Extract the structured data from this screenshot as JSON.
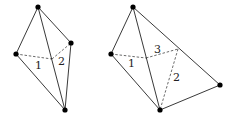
{
  "figures": [
    {
      "name": "left-tetrahedron",
      "vertices": {
        "top": [
          38,
          7
        ],
        "right": [
          71,
          43
        ],
        "left": [
          16,
          54
        ],
        "bottom": [
          65,
          110
        ]
      },
      "interior_point": [
        52,
        59
      ],
      "solid_edges": [
        [
          "top",
          "right"
        ],
        [
          "top",
          "left"
        ],
        [
          "top",
          "bottom"
        ],
        [
          "left",
          "bottom"
        ],
        [
          "right",
          "bottom"
        ]
      ],
      "dashed_edges": [
        [
          "left",
          "interior"
        ],
        [
          "interior",
          "right"
        ]
      ],
      "labels": [
        {
          "text": "1",
          "x": 35,
          "y": 69
        },
        {
          "text": "2",
          "x": 58,
          "y": 65
        }
      ]
    },
    {
      "name": "right-tetrahedron",
      "vertices": {
        "top": [
          133,
          7
        ],
        "left": [
          111,
          54
        ],
        "right": [
          220,
          85
        ],
        "bottom": [
          160,
          110
        ]
      },
      "interior_point": [
        146,
        58
      ],
      "hidden_point": [
        178,
        49
      ],
      "solid_edges": [
        [
          "top",
          "left"
        ],
        [
          "top",
          "right"
        ],
        [
          "top",
          "bottom"
        ],
        [
          "left",
          "bottom"
        ],
        [
          "bottom",
          "right"
        ]
      ],
      "dashed_edges": [
        [
          "left",
          "interior"
        ],
        [
          "interior",
          "hidden"
        ],
        [
          "hidden",
          "bottom"
        ]
      ],
      "labels": [
        {
          "text": "1",
          "x": 128,
          "y": 67
        },
        {
          "text": "3",
          "x": 154,
          "y": 53
        },
        {
          "text": "2",
          "x": 173,
          "y": 81
        }
      ]
    }
  ]
}
